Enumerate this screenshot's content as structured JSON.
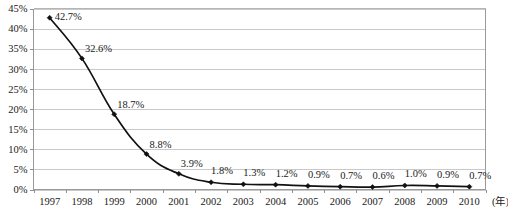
{
  "chart_data": {
    "type": "line",
    "title": "",
    "xlabel": "(年)",
    "ylabel": "",
    "grid": true,
    "legend": false,
    "xlim": [
      1997,
      2010
    ],
    "ylim": [
      0,
      45
    ],
    "categories": [
      "1997",
      "1998",
      "1999",
      "2000",
      "2001",
      "2002",
      "2003",
      "2004",
      "2005",
      "2006",
      "2007",
      "2008",
      "2009",
      "2010"
    ],
    "values": [
      42.7,
      32.6,
      18.7,
      8.8,
      3.9,
      1.8,
      1.3,
      1.2,
      0.9,
      0.7,
      0.6,
      1.0,
      0.9,
      0.7
    ],
    "point_labels": [
      "42.7%",
      "32.6%",
      "18.7%",
      "8.8%",
      "3.9%",
      "1.8%",
      "1.3%",
      "1.2%",
      "0.9%",
      "0.7%",
      "0.6%",
      "1.0%",
      "0.9%",
      "0.7%"
    ],
    "ytick_labels": [
      "0%",
      "5%",
      "10%",
      "15%",
      "20%",
      "25%",
      "30%",
      "35%",
      "40%",
      "45%"
    ],
    "ytick_values": [
      0,
      5,
      10,
      15,
      20,
      25,
      30,
      35,
      40,
      45
    ],
    "series": [
      {
        "name": "",
        "values": [
          42.7,
          32.6,
          18.7,
          8.8,
          3.9,
          1.8,
          1.3,
          1.2,
          0.9,
          0.7,
          0.6,
          1.0,
          0.9,
          0.7
        ]
      }
    ],
    "colors": {
      "line": "#111111",
      "marker": "#111111",
      "grid": "#c9c9c9",
      "axis": "#9a9a9a",
      "text": "#1a1a1a",
      "background": "#ffffff"
    }
  }
}
